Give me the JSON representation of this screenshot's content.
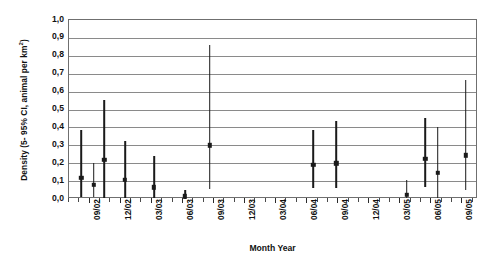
{
  "chart_data": {
    "type": "scatter",
    "title": "",
    "xlabel": "Month Year",
    "ylabel": "Density (5- 95% CI, animal per km²)",
    "ylabel_main": "Density (5- 95% CI, animal per km",
    "ylabel_sup": "2",
    "ylabel_tail": ")",
    "ylim": [
      0.0,
      1.0
    ],
    "ytick_labels": [
      "1,0",
      "0,9",
      "0,8",
      "0,7",
      "0,6",
      "0,5",
      "0,4",
      "0,3",
      "0,2",
      "0,1",
      "0,0"
    ],
    "ytick_values": [
      1.0,
      0.9,
      0.8,
      0.7,
      0.6,
      0.5,
      0.4,
      0.3,
      0.2,
      0.1,
      0.0
    ],
    "xtick_labels": [
      "09/02",
      "12/02",
      "03/03",
      "06/03",
      "09/03",
      "12/03",
      "03/04",
      "06/04",
      "09/04",
      "12/04",
      "03/05",
      "06/05",
      "09/05"
    ],
    "xtick_positions": [
      4.0,
      7.0,
      10.0,
      13.0,
      16.0,
      19.0,
      22.0,
      25.0,
      28.0,
      31.0,
      34.0,
      37.0,
      40.0
    ],
    "x_minor_step_months": 1,
    "x_range": [
      2.0,
      41.5
    ],
    "grid": "horizontal",
    "legend": "none",
    "series": [
      {
        "name": "Density estimate with 5-95% CI",
        "points": [
          {
            "x": 3.2,
            "month": "08/02",
            "estimate": 0.12,
            "low": 0.01,
            "high": 0.385
          },
          {
            "x": 4.4,
            "month": "09/02",
            "estimate": 0.08,
            "low": 0.01,
            "high": 0.2
          },
          {
            "x": 5.4,
            "month": "10/02",
            "estimate": 0.22,
            "low": 0.005,
            "high": 0.555
          },
          {
            "x": 7.4,
            "month": "12/02",
            "estimate": 0.108,
            "low": 0.005,
            "high": 0.325
          },
          {
            "x": 10.2,
            "month": "03/03",
            "estimate": 0.065,
            "low": 0.005,
            "high": 0.24
          },
          {
            "x": 13.2,
            "month": "06/03",
            "estimate": 0.015,
            "low": 0.0,
            "high": 0.05
          },
          {
            "x": 15.6,
            "month": "09/03",
            "estimate": 0.3,
            "low": 0.055,
            "high": 0.86
          },
          {
            "x": 25.6,
            "month": "07/04",
            "estimate": 0.19,
            "low": 0.06,
            "high": 0.385
          },
          {
            "x": 27.8,
            "month": "09/04",
            "estimate": 0.2,
            "low": 0.06,
            "high": 0.435
          },
          {
            "x": 34.6,
            "month": "04/05",
            "estimate": 0.025,
            "low": 0.005,
            "high": 0.105
          },
          {
            "x": 36.4,
            "month": "05/05",
            "estimate": 0.225,
            "low": 0.065,
            "high": 0.455
          },
          {
            "x": 37.6,
            "month": "06/05",
            "estimate": 0.145,
            "low": 0.005,
            "high": 0.4
          },
          {
            "x": 40.3,
            "month": "09/05",
            "estimate": 0.245,
            "low": 0.05,
            "high": 0.665
          }
        ]
      }
    ],
    "colors": {
      "marker": "#1a1a1a",
      "whisker": "#1a1a1a",
      "gridline": "#8a8a8a",
      "frame": "#6f6f6f",
      "background": "#ffffff",
      "text": "#111111"
    }
  }
}
